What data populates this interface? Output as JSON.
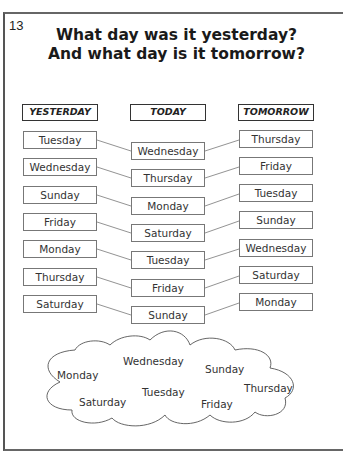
{
  "page_number": "13",
  "title": {
    "line1": "What day was it yesterday?",
    "line2": "And what day is it tomorrow?"
  },
  "columns": {
    "yesterday": "YESTERDAY",
    "today": "TODAY",
    "tomorrow": "TOMORROW"
  },
  "rows": [
    {
      "yesterday": "Tuesday",
      "today": "Wednesday",
      "tomorrow": "Thursday"
    },
    {
      "yesterday": "Wednesday",
      "today": "Thursday",
      "tomorrow": "Friday"
    },
    {
      "yesterday": "Sunday",
      "today": "Monday",
      "tomorrow": "Tuesday"
    },
    {
      "yesterday": "Friday",
      "today": "Saturday",
      "tomorrow": "Sunday"
    },
    {
      "yesterday": "Monday",
      "today": "Tuesday",
      "tomorrow": "Wednesday"
    },
    {
      "yesterday": "Thursday",
      "today": "Friday",
      "tomorrow": "Saturday"
    },
    {
      "yesterday": "Saturday",
      "today": "Sunday",
      "tomorrow": "Monday"
    }
  ],
  "cloud_words": [
    "Monday",
    "Wednesday",
    "Sunday",
    "Saturday",
    "Tuesday",
    "Friday",
    "Thursday"
  ]
}
